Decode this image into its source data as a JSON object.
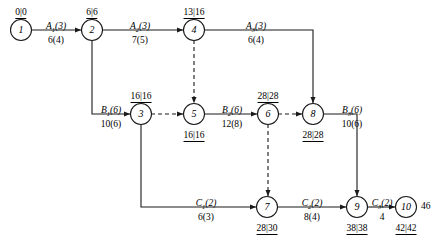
{
  "diagram": {
    "colors": {
      "stroke": "#1a1a1a",
      "background": "#ffffff",
      "text": "#000000"
    },
    "nodes": [
      {
        "id": "1",
        "label": "1",
        "time_label": "0|0",
        "time_pos": "above",
        "x": 21,
        "y": 30
      },
      {
        "id": "2",
        "label": "2",
        "time_label": "6|6",
        "time_pos": "above",
        "x": 92,
        "y": 30
      },
      {
        "id": "4",
        "label": "4",
        "time_label": "13|16",
        "time_pos": "above",
        "x": 194,
        "y": 30
      },
      {
        "id": "3",
        "label": "3",
        "time_label": "16|16",
        "time_pos": "above",
        "x": 141,
        "y": 114
      },
      {
        "id": "5",
        "label": "5",
        "time_label": "16|16",
        "time_pos": "below",
        "x": 194,
        "y": 114
      },
      {
        "id": "6",
        "label": "6",
        "time_label": "28|28",
        "time_pos": "above",
        "x": 268,
        "y": 114
      },
      {
        "id": "8",
        "label": "8",
        "time_label": "28|28",
        "time_pos": "below",
        "x": 313,
        "y": 114
      },
      {
        "id": "7",
        "label": "7",
        "time_label": "28|30",
        "time_pos": "below",
        "x": 267,
        "y": 207
      },
      {
        "id": "9",
        "label": "9",
        "time_label": "38|38",
        "time_pos": "below",
        "x": 357,
        "y": 207
      },
      {
        "id": "10",
        "label": "10",
        "time_label": "42|42",
        "time_pos": "below",
        "x": 406,
        "y": 207
      }
    ],
    "edges": [
      {
        "id": "e1",
        "from": "1",
        "to": "2",
        "name": "A",
        "sub": "1",
        "float": "(3)",
        "duration": "6(4)",
        "style": "solid",
        "name_x": 56,
        "name_y": 22,
        "dur_x": 56,
        "dur_y": 36
      },
      {
        "id": "e2",
        "from": "2",
        "to": "4",
        "name": "A",
        "sub": "2",
        "float": "(3)",
        "duration": "7(5)",
        "style": "solid",
        "name_x": 140,
        "name_y": 22,
        "dur_x": 140,
        "dur_y": 36
      },
      {
        "id": "e3",
        "from": "4",
        "to": "8",
        "name": "A",
        "sub": "3",
        "float": "(3)",
        "duration": "6(4)",
        "style": "solid",
        "name_x": 256,
        "name_y": 22,
        "dur_x": 256,
        "dur_y": 36
      },
      {
        "id": "e4",
        "from": "2",
        "to": "3",
        "name": "B",
        "sub": "1",
        "float": "(6)",
        "duration": "10(6)",
        "style": "solid",
        "name_x": 111,
        "name_y": 106,
        "dur_x": 111,
        "dur_y": 120
      },
      {
        "id": "e5",
        "from": "3",
        "to": "5",
        "name": "",
        "sub": "",
        "float": "",
        "duration": "",
        "style": "dashed",
        "name_x": 0,
        "name_y": 0,
        "dur_x": 0,
        "dur_y": 0
      },
      {
        "id": "e6",
        "from": "5",
        "to": "6",
        "name": "B",
        "sub": "2",
        "float": "(6)",
        "duration": "12(8)",
        "style": "solid",
        "name_x": 232,
        "name_y": 106,
        "dur_x": 232,
        "dur_y": 120
      },
      {
        "id": "e7",
        "from": "6",
        "to": "8",
        "name": "",
        "sub": "",
        "float": "",
        "duration": "",
        "style": "dashed",
        "name_x": 0,
        "name_y": 0,
        "dur_x": 0,
        "dur_y": 0
      },
      {
        "id": "e8",
        "from": "4",
        "to": "5",
        "name": "",
        "sub": "",
        "float": "",
        "duration": "",
        "style": "dashed",
        "name_x": 0,
        "name_y": 0,
        "dur_x": 0,
        "dur_y": 0
      },
      {
        "id": "e9",
        "from": "6",
        "to": "7",
        "name": "",
        "sub": "",
        "float": "",
        "duration": "",
        "style": "dashed",
        "name_x": 0,
        "name_y": 0,
        "dur_x": 0,
        "dur_y": 0
      },
      {
        "id": "e10",
        "from": "8",
        "to": "9",
        "name": "B",
        "sub": "3",
        "float": "(6)",
        "duration": "10(6)",
        "style": "solid",
        "name_x": 352,
        "name_y": 106,
        "dur_x": 352,
        "dur_y": 120
      },
      {
        "id": "e11",
        "from": "3",
        "to": "7",
        "name": "C",
        "sub": "1",
        "float": "(2)",
        "duration": "6(3)",
        "style": "solid",
        "name_x": 206,
        "name_y": 199,
        "dur_x": 206,
        "dur_y": 213
      },
      {
        "id": "e12",
        "from": "7",
        "to": "9",
        "name": "C",
        "sub": "2",
        "float": "(2)",
        "duration": "8(4)",
        "style": "solid",
        "name_x": 312,
        "name_y": 199,
        "dur_x": 312,
        "dur_y": 213
      },
      {
        "id": "e13",
        "from": "9",
        "to": "10",
        "name": "C",
        "sub": "3",
        "float": "(2)",
        "duration": "4",
        "style": "solid",
        "name_x": 382,
        "name_y": 199,
        "dur_x": 382,
        "dur_y": 213
      }
    ],
    "end_value": {
      "text": "46",
      "x": 421,
      "y": 207
    }
  }
}
